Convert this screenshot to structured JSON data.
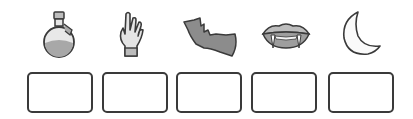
{
  "items": [
    {
      "icon": "potion-icon",
      "answer": ""
    },
    {
      "icon": "zombie-hand-icon",
      "answer": ""
    },
    {
      "icon": "bat-icon",
      "answer": ""
    },
    {
      "icon": "vampire-fangs-icon",
      "answer": ""
    },
    {
      "icon": "crescent-moon-icon",
      "answer": ""
    }
  ],
  "colors": {
    "stroke": "#3a3a3a",
    "fill": "#9a9a9a",
    "light": "#cfcfcf"
  }
}
